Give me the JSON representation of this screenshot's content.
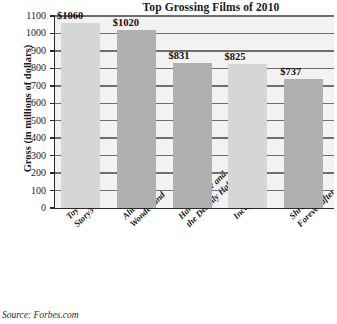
{
  "chart_data": {
    "type": "bar",
    "title": "Top Grossing Films of 2010",
    "xlabel": "",
    "ylabel": "Gross (in millions of dollars)",
    "categories": [
      "Toy Story3",
      "Alice in Wonderland",
      "Harry Potter and the Deathly Hallows",
      "Inception",
      "Shrek Forever after"
    ],
    "category_lines": [
      [
        "Toy",
        "Story3"
      ],
      [
        "Alice in",
        "Wonderland"
      ],
      [
        "Harry Potter and",
        "the Deathly Hallows"
      ],
      [
        "Inception"
      ],
      [
        "Shrek",
        "Forever after"
      ]
    ],
    "values": [
      1060,
      1020,
      831,
      825,
      737
    ],
    "data_labels": [
      "$1060",
      "$1020",
      "$831",
      "$825",
      "$737"
    ],
    "ylim": [
      0,
      1100
    ],
    "ytick_step": 100,
    "ytick_labels": [
      "1100",
      "1000",
      "900",
      "800",
      "700",
      "600",
      "500",
      "400",
      "300",
      "200",
      "100",
      "0"
    ],
    "grid": true,
    "legend": "none",
    "bar_colors": [
      "#d6d6d6",
      "#b0b0b0",
      "#b0b0b0",
      "#d6d6d6",
      "#b0b0b0"
    ],
    "plot_background": "#f2f2f2",
    "axis_color": "#2b2b2b",
    "gridline_color": "#6e6e6e"
  },
  "source": {
    "note": "Source: Forbes.com"
  }
}
